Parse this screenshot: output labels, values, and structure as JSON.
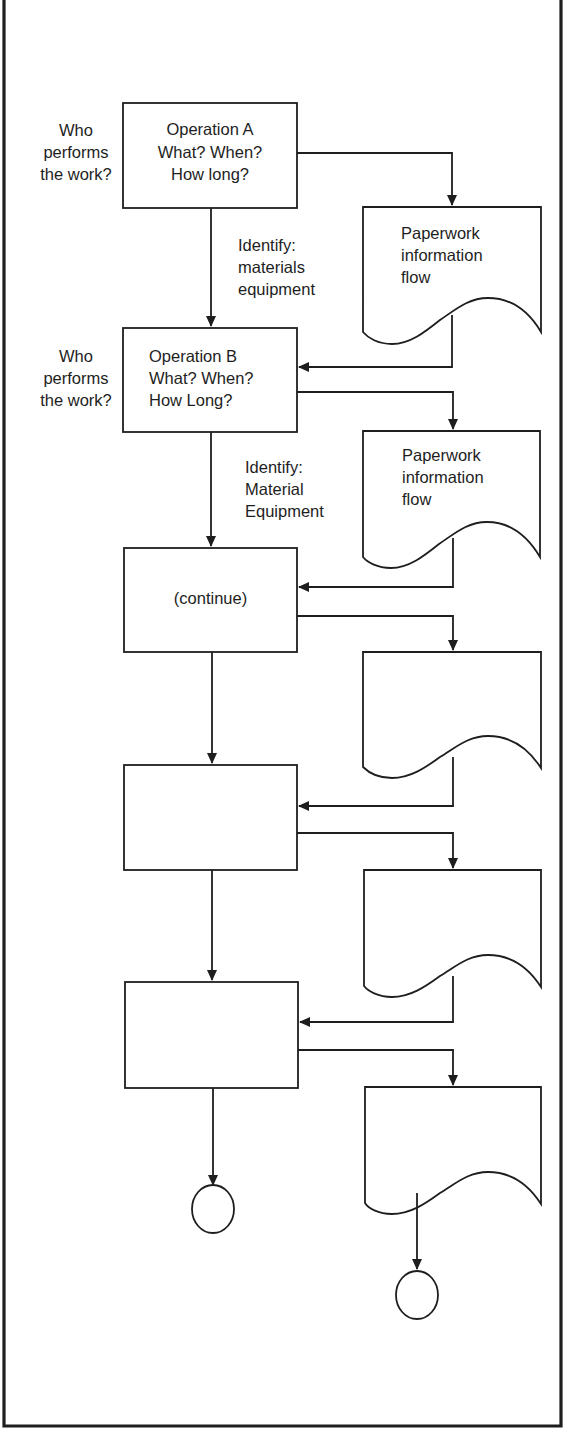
{
  "diagram": {
    "colors": {
      "line": "#1e1e1e",
      "background": "#ffffff",
      "text": "#1e1e1e"
    },
    "operations": [
      {
        "id": "op-a",
        "lines": [
          "Operation A",
          "What? When?",
          "How long?"
        ],
        "align": "center",
        "who_label": [
          "Who",
          "performs",
          "the work?"
        ],
        "identify_label": [
          "Identify:",
          "materials",
          "equipment"
        ]
      },
      {
        "id": "op-b",
        "lines": [
          "Operation B",
          "What? When?",
          "How Long?"
        ],
        "align": "left",
        "who_label": [
          "Who",
          "performs",
          "the work?"
        ],
        "identify_label": [
          "Identify:",
          "Material",
          "Equipment"
        ]
      },
      {
        "id": "op-continue",
        "lines": [
          "(continue)"
        ],
        "align": "center"
      },
      {
        "id": "op-4",
        "lines": []
      },
      {
        "id": "op-5",
        "lines": []
      }
    ],
    "documents": [
      {
        "id": "doc-a",
        "lines": [
          "Paperwork",
          "information",
          "flow"
        ]
      },
      {
        "id": "doc-b",
        "lines": [
          "Paperwork",
          "information",
          "flow"
        ]
      },
      {
        "id": "doc-c",
        "lines": []
      },
      {
        "id": "doc-d",
        "lines": []
      },
      {
        "id": "doc-e",
        "lines": []
      }
    ],
    "terminators": [
      {
        "id": "end-operations",
        "shape": "circle"
      },
      {
        "id": "end-paperwork",
        "shape": "circle"
      }
    ]
  }
}
